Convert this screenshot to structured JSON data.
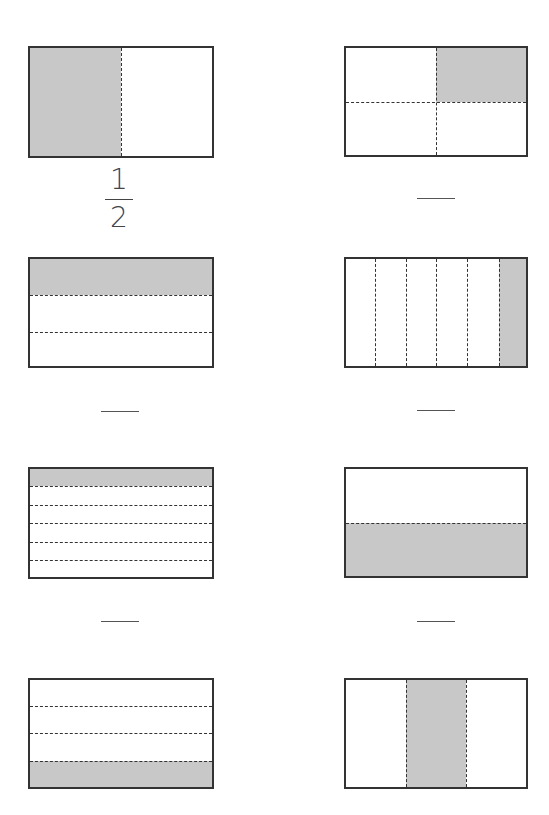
{
  "worksheet": {
    "shade_color": "#c8c8c8",
    "border_color": "#333333",
    "problems": [
      {
        "id": 1,
        "divisions": 2,
        "orientation": "vertical",
        "shaded": [
          0
        ],
        "answer": {
          "numerator": "1",
          "denominator": "2"
        }
      },
      {
        "id": 2,
        "divisions": 4,
        "orientation": "grid-2x2",
        "shaded": [
          1
        ],
        "answer": null
      },
      {
        "id": 3,
        "divisions": 3,
        "orientation": "horizontal",
        "shaded": [
          0
        ],
        "answer": null
      },
      {
        "id": 4,
        "divisions": 6,
        "orientation": "vertical",
        "shaded": [
          5
        ],
        "answer": null
      },
      {
        "id": 5,
        "divisions": 6,
        "orientation": "horizontal",
        "shaded": [
          0
        ],
        "answer": null
      },
      {
        "id": 6,
        "divisions": 2,
        "orientation": "horizontal",
        "shaded": [
          1
        ],
        "answer": null
      },
      {
        "id": 7,
        "divisions": 4,
        "orientation": "horizontal",
        "shaded": [
          3
        ],
        "answer": null
      },
      {
        "id": 8,
        "divisions": 3,
        "orientation": "vertical",
        "shaded": [
          1
        ],
        "answer": null
      }
    ]
  }
}
